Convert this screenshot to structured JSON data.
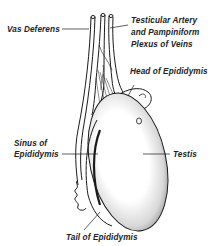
{
  "diagram": {
    "labels": {
      "vas_deferens": "Vas Deferens",
      "testicular_artery_line1": "Testicular Artery",
      "testicular_artery_line2": "and Pampiniform",
      "testicular_artery_line3": "Plexus of Veins",
      "head_of_epididymis": "Head of Epididymis",
      "sinus_line1": "Sinus of",
      "sinus_line2": "Epididymis",
      "testis": "Testis",
      "tail_of_epididymis": "Tail of Epididymis"
    },
    "colors": {
      "ink": "#1a1a1a",
      "background": "#ffffff"
    }
  }
}
